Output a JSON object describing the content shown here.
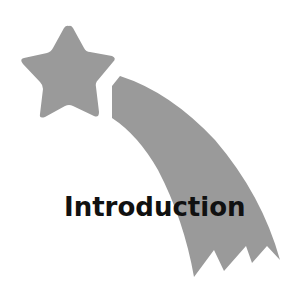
{
  "graphic": {
    "icon": "shooting-star-icon",
    "fill_color": "#9a9a9a",
    "background": "#ffffff"
  },
  "title": "Introduction",
  "title_color": "#111111"
}
